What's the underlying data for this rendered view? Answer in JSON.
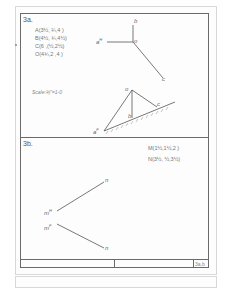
{
  "problem_a": {
    "title": "3a.",
    "coordinates": [
      "A(3½, ¼,4 )",
      "B(4½, ¾,4½)",
      "C(6 ,(½,2½)",
      "O(4¾,2 ,4 )"
    ],
    "scale": "Scale:⅛\"=1-0",
    "top_view_labels": {
      "a": "a",
      "a_superscript": "H",
      "b": "b",
      "o": "o",
      "c": "c"
    },
    "side_view_labels": {
      "o": "o",
      "a": "a",
      "a_superscript": "F",
      "b": "b",
      "c": "c"
    }
  },
  "problem_b": {
    "title": "3b.",
    "coordinates": [
      "M(1½,1½,2 )",
      "N(3½, ½,3½)"
    ],
    "labels": {
      "m_h": "m",
      "m_h_superscript": "H",
      "m_f": "m",
      "m_f_superscript": "F",
      "n_top": "n",
      "n_bottom": "n"
    }
  },
  "title_block": {
    "sheet_id": "3a,b"
  },
  "colors": {
    "frame": "#6a6a6a",
    "line": "#555555",
    "text": "#666666",
    "page_border": "#d8d8d8"
  }
}
